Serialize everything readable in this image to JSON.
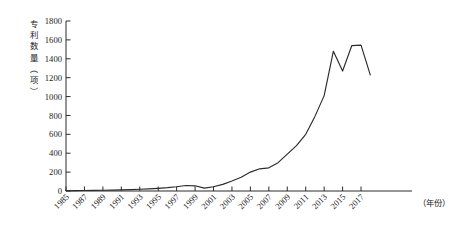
{
  "chart_data": {
    "type": "line",
    "title": "",
    "xlabel": "（年份）",
    "ylabel": "专利数量（项）",
    "xlim": [
      1985,
      2018
    ],
    "ylim": [
      0,
      1800
    ],
    "grid": false,
    "legend": "none",
    "y_ticks": [
      0,
      200,
      400,
      600,
      800,
      1000,
      1200,
      1400,
      1600,
      1800
    ],
    "x_ticks": [
      1985,
      1987,
      1989,
      1991,
      1993,
      1995,
      1997,
      1999,
      2001,
      2003,
      2005,
      2007,
      2009,
      2011,
      2013,
      2015,
      2017
    ],
    "x": [
      1985,
      1986,
      1987,
      1988,
      1989,
      1990,
      1991,
      1992,
      1993,
      1994,
      1995,
      1996,
      1997,
      1998,
      1999,
      2000,
      2001,
      2002,
      2003,
      2004,
      2005,
      2006,
      2007,
      2008,
      2009,
      2010,
      2011,
      2012,
      2013,
      2014,
      2015,
      2016,
      2017,
      2018
    ],
    "values": [
      3,
      4,
      5,
      6,
      8,
      10,
      12,
      14,
      18,
      22,
      28,
      35,
      45,
      58,
      55,
      30,
      45,
      70,
      105,
      145,
      200,
      235,
      245,
      300,
      390,
      480,
      600,
      790,
      1010,
      1480,
      1270,
      1540,
      1545,
      1230
    ],
    "series_name": "专利数量",
    "line_color": "#2b2b2b"
  },
  "axis": {
    "y_title_chars": [
      "专",
      "利",
      "数",
      "量",
      "（",
      "项",
      "）"
    ],
    "x_title": "（年份）"
  }
}
